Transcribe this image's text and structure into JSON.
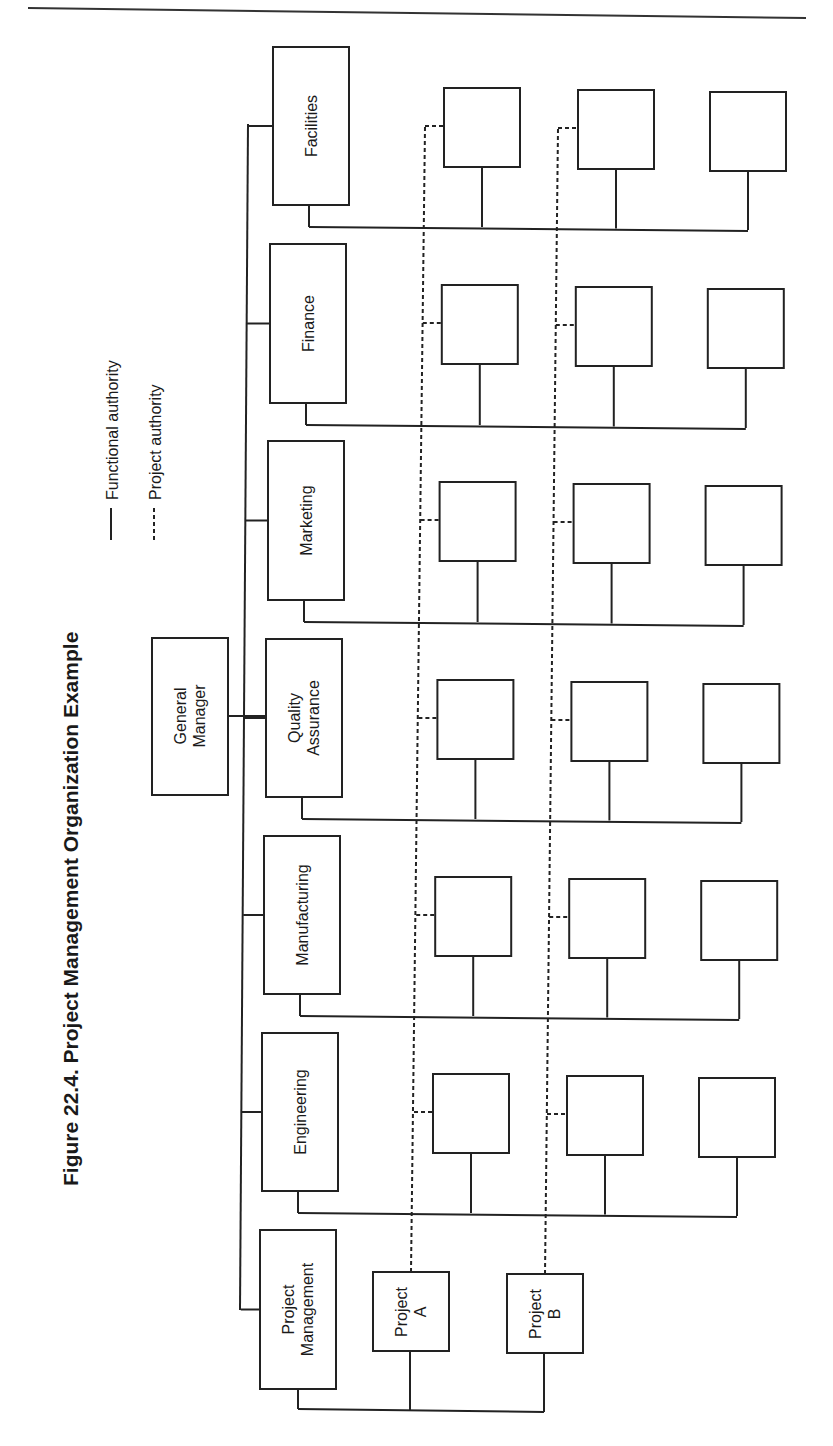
{
  "figure": {
    "title": "Figure 22.4.  Project Management Organization Example",
    "legend": {
      "functional": "Functional authority",
      "project": "Project authority"
    }
  },
  "nodes": {
    "general_manager": [
      "General",
      "Manager"
    ],
    "departments": [
      {
        "key": "facilities",
        "lines": [
          "Facilities"
        ]
      },
      {
        "key": "finance",
        "lines": [
          "Finance"
        ]
      },
      {
        "key": "marketing",
        "lines": [
          "Marketing"
        ]
      },
      {
        "key": "quality-assurance",
        "lines": [
          "Quality",
          "Assurance"
        ]
      },
      {
        "key": "manufacturing",
        "lines": [
          "Manufacturing"
        ]
      },
      {
        "key": "engineering",
        "lines": [
          "Engineering"
        ]
      },
      {
        "key": "project-management",
        "lines": [
          "Project",
          "Management"
        ]
      }
    ],
    "projects": [
      {
        "key": "project-a",
        "lines": [
          "Project",
          "A"
        ]
      },
      {
        "key": "project-b",
        "lines": [
          "Project",
          "B"
        ]
      }
    ],
    "staff_boxes_per_department": 3
  },
  "colors": {
    "ink": "#222222",
    "paper": "#ffffff"
  }
}
